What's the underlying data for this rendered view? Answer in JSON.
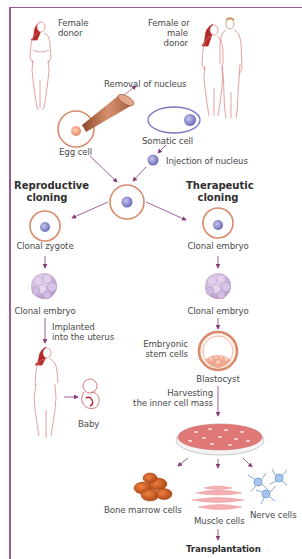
{
  "diagram": {
    "type": "process-flow",
    "colors": {
      "frame": "#9b5a9b",
      "arrow": "#8a3a7a",
      "egg_ring": "#d98a6a",
      "nucleus": "#7a7ac8",
      "figure_outline": "#c85a5a",
      "hair": "#b42828",
      "muscle": "#f0a0a0",
      "bone_marrow": "#d8622a",
      "nerve": "#8aaee0",
      "petri": "#e07878"
    },
    "donors": {
      "left_label": "Female\ndonor",
      "left_line1": "Female",
      "left_line2": "donor",
      "right_line1": "Female or",
      "right_line2": "male",
      "right_line3": "donor"
    },
    "steps": {
      "removal": "Removal of nucleus",
      "egg_cell": "Egg cell",
      "somatic_cell": "Somatic cell",
      "injection": "Injection of nucleus"
    },
    "branches": {
      "reproductive": {
        "title_line1": "Reproductive",
        "title_line2": "cloning",
        "nodes": {
          "zygote": "Clonal zygote",
          "embryo": "Clonal embryo",
          "implant_line1": "Implanted",
          "implant_line2": "into the uterus",
          "baby": "Baby"
        }
      },
      "therapeutic": {
        "title_line1": "Therapeutic",
        "title_line2": "cloning",
        "nodes": {
          "embryo1": "Clonal embryo",
          "embryo2": "Clonal embryo",
          "stem_line1": "Embryonic",
          "stem_line2": "stem cells",
          "blastocyst": "Blastocyst",
          "harvest_line1": "Harvesting",
          "harvest_line2": "the inner cell mass",
          "bone_marrow": "Bone marrow cells",
          "muscle": "Muscle cells",
          "nerve": "Nerve cells",
          "transplantation": "Transplantation"
        }
      }
    }
  }
}
